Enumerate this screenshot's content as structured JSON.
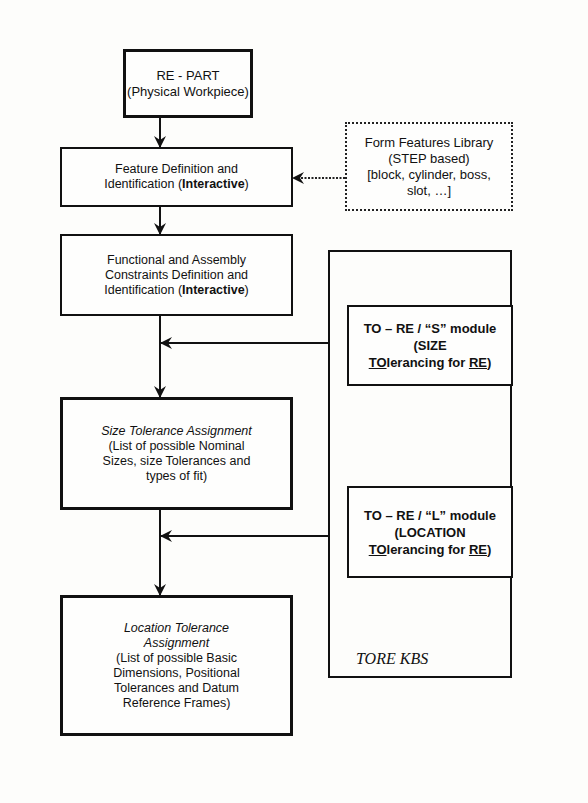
{
  "diagram": {
    "main_flow": [
      {
        "id": "re-part",
        "lines": [
          {
            "text": "RE - PART",
            "style": "normal"
          },
          {
            "text": "(Physical Workpiece)",
            "style": "normal"
          }
        ]
      },
      {
        "id": "feature-definition",
        "lines": [
          {
            "text": "Feature Definition and",
            "style": "normal"
          },
          {
            "prefix": "Identification (",
            "bold": "Interactive",
            "suffix": ")"
          }
        ]
      },
      {
        "id": "functional-constraints",
        "lines": [
          {
            "text": "Functional and Assembly",
            "style": "normal"
          },
          {
            "text": "Constraints Definition and",
            "style": "normal"
          },
          {
            "prefix": "Identification (",
            "bold": "Interactive",
            "suffix": ")"
          }
        ]
      },
      {
        "id": "size-tolerance",
        "lines": [
          {
            "text": "Size Tolerance Assignment",
            "style": "italic"
          },
          {
            "text": "(List of possible Nominal",
            "style": "normal"
          },
          {
            "text": "Sizes, size Tolerances and",
            "style": "normal"
          },
          {
            "text": "types of fit)",
            "style": "normal"
          }
        ]
      },
      {
        "id": "location-tolerance",
        "lines": [
          {
            "text": "Location Tolerance",
            "style": "italic"
          },
          {
            "text": "Assignment",
            "style": "italic"
          },
          {
            "text": "(List of possible Basic",
            "style": "normal"
          },
          {
            "text": "Dimensions, Positional",
            "style": "normal"
          },
          {
            "text": "Tolerances and Datum",
            "style": "normal"
          },
          {
            "text": "Reference Frames)",
            "style": "normal"
          }
        ]
      }
    ],
    "form_features_library": {
      "lines": [
        "Form Features Library",
        "(STEP based)",
        "[block, cylinder, boss,",
        "slot, …]"
      ]
    },
    "tore_kbs": {
      "label": "TORE KBS",
      "modules": [
        {
          "id": "s-module",
          "line1": "TO – RE / “S” module",
          "line2": "(SIZE",
          "line3_underlined_a": "TO",
          "line3_middle": "lerancing for ",
          "line3_underlined_b": "RE",
          "line3_suffix": ")"
        },
        {
          "id": "l-module",
          "line1": "TO – RE / “L” module",
          "line2": "(LOCATION",
          "line3_underlined_a": "TO",
          "line3_middle": "lerancing for ",
          "line3_underlined_b": "RE",
          "line3_suffix": ")"
        }
      ]
    }
  }
}
